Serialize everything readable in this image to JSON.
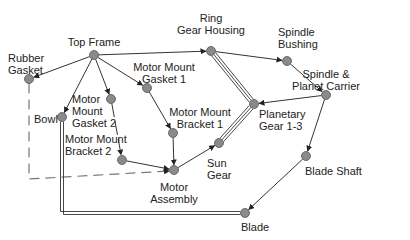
{
  "diagram": {
    "type": "assembly-liaison-graph",
    "nodes": [
      {
        "id": "top_frame",
        "label": "Top Frame",
        "x": 94,
        "y": 55
      },
      {
        "id": "rubber_gasket",
        "label": "Rubber\nGasket",
        "x": 29,
        "y": 79
      },
      {
        "id": "ring_gear_housing",
        "label": "Ring\nGear Housing",
        "x": 211,
        "y": 51
      },
      {
        "id": "spindle_bushing",
        "label": "Spindle\nBushing",
        "x": 287,
        "y": 61
      },
      {
        "id": "spindle_planet_carrier",
        "label": "Spindle &\nPlanet Carrier",
        "x": 326,
        "y": 95
      },
      {
        "id": "planetary_gear",
        "label": "Planetary\nGear 1-3",
        "x": 254,
        "y": 104
      },
      {
        "id": "motor_mount_gasket_1",
        "label": "Motor Mount\nGasket 1",
        "x": 147,
        "y": 88
      },
      {
        "id": "bowl",
        "label": "Bowl",
        "x": 62,
        "y": 117
      },
      {
        "id": "motor_mount_gasket_2",
        "label": "Motor\nMount\nGasket 2",
        "x": 111,
        "y": 99
      },
      {
        "id": "motor_mount_bracket_1",
        "label": "Motor Mount\nBracket 1",
        "x": 173,
        "y": 133
      },
      {
        "id": "sun_gear",
        "label": "Sun\nGear",
        "x": 219,
        "y": 143
      },
      {
        "id": "motor_mount_bracket_2",
        "label": "Motor Mount\nBracket 2",
        "x": 122,
        "y": 160
      },
      {
        "id": "motor_assembly",
        "label": "Motor\nAssembly",
        "x": 174,
        "y": 170
      },
      {
        "id": "blade_shaft",
        "label": "Blade Shaft",
        "x": 306,
        "y": 156
      },
      {
        "id": "blade",
        "label": "Blade",
        "x": 245,
        "y": 213
      }
    ],
    "edges": [
      {
        "from": "top_frame",
        "to": "rubber_gasket",
        "style": "arrow"
      },
      {
        "from": "top_frame",
        "to": "ring_gear_housing",
        "style": "arrow"
      },
      {
        "from": "top_frame",
        "to": "bowl",
        "style": "arrow"
      },
      {
        "from": "top_frame",
        "to": "motor_mount_gasket_2",
        "style": "arrow"
      },
      {
        "from": "top_frame",
        "to": "motor_mount_gasket_1",
        "style": "arrow"
      },
      {
        "from": "ring_gear_housing",
        "to": "spindle_bushing",
        "style": "arrow"
      },
      {
        "from": "spindle_bushing",
        "to": "spindle_planet_carrier",
        "style": "arrow"
      },
      {
        "from": "spindle_planet_carrier",
        "to": "planetary_gear",
        "style": "arrow"
      },
      {
        "from": "spindle_planet_carrier",
        "to": "blade_shaft",
        "style": "arrow"
      },
      {
        "from": "blade_shaft",
        "to": "blade",
        "style": "arrow"
      },
      {
        "from": "motor_mount_gasket_1",
        "to": "motor_mount_bracket_1",
        "style": "arrow"
      },
      {
        "from": "motor_mount_bracket_1",
        "to": "motor_assembly",
        "style": "arrow"
      },
      {
        "from": "motor_mount_gasket_2",
        "to": "motor_mount_bracket_2",
        "style": "dashed-arrow"
      },
      {
        "from": "motor_mount_bracket_2",
        "to": "motor_assembly",
        "style": "arrow"
      },
      {
        "from": "motor_assembly",
        "to": "sun_gear",
        "style": "arrow"
      },
      {
        "from": "rubber_gasket",
        "to": "motor_assembly",
        "style": "dashed-arrow"
      },
      {
        "from": "ring_gear_housing",
        "to": "planetary_gear",
        "style": "triple-line"
      },
      {
        "from": "sun_gear",
        "to": "planetary_gear",
        "style": "triple-line"
      },
      {
        "from": "bowl",
        "to": "blade",
        "style": "double-line"
      }
    ],
    "colors": {
      "node_fill": "#8a8a8a",
      "node_stroke": "#555555",
      "edge": "#333333",
      "dashed": "#777777"
    }
  }
}
